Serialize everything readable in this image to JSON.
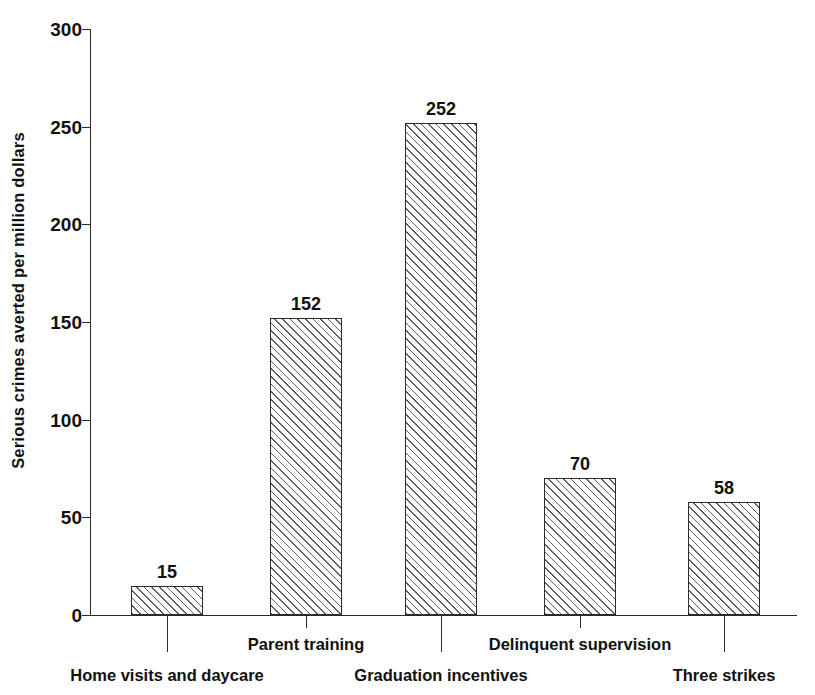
{
  "chart_data": {
    "type": "bar",
    "title": "",
    "xlabel": "",
    "ylabel": "Serious crimes averted per million dollars",
    "ylim": [
      0,
      300
    ],
    "ytick_values": [
      0,
      50,
      100,
      150,
      200,
      250,
      300
    ],
    "ytick_labels": [
      "0",
      "50",
      "100",
      "150",
      "200",
      "250",
      "300"
    ],
    "grid": false,
    "legend": false,
    "categories": [
      "Home visits and daycare",
      "Parent training",
      "Graduation incentives",
      "Delinquent supervision",
      "Three strikes"
    ],
    "values": [
      15,
      152,
      252,
      70,
      58
    ],
    "value_labels": [
      "15",
      "152",
      "252",
      "70",
      "58"
    ],
    "bar_style": {
      "fill": "diagonal-hatch",
      "hatch_color": "#5f5f5f",
      "edge_color": "#2b2b2b",
      "background": "#ffffff"
    },
    "label_rows": [
      "lower",
      "upper",
      "lower",
      "upper",
      "lower"
    ]
  },
  "axis": {
    "line_color": "#2a2a2a",
    "y_title": "Serious crimes averted per million dollars"
  }
}
